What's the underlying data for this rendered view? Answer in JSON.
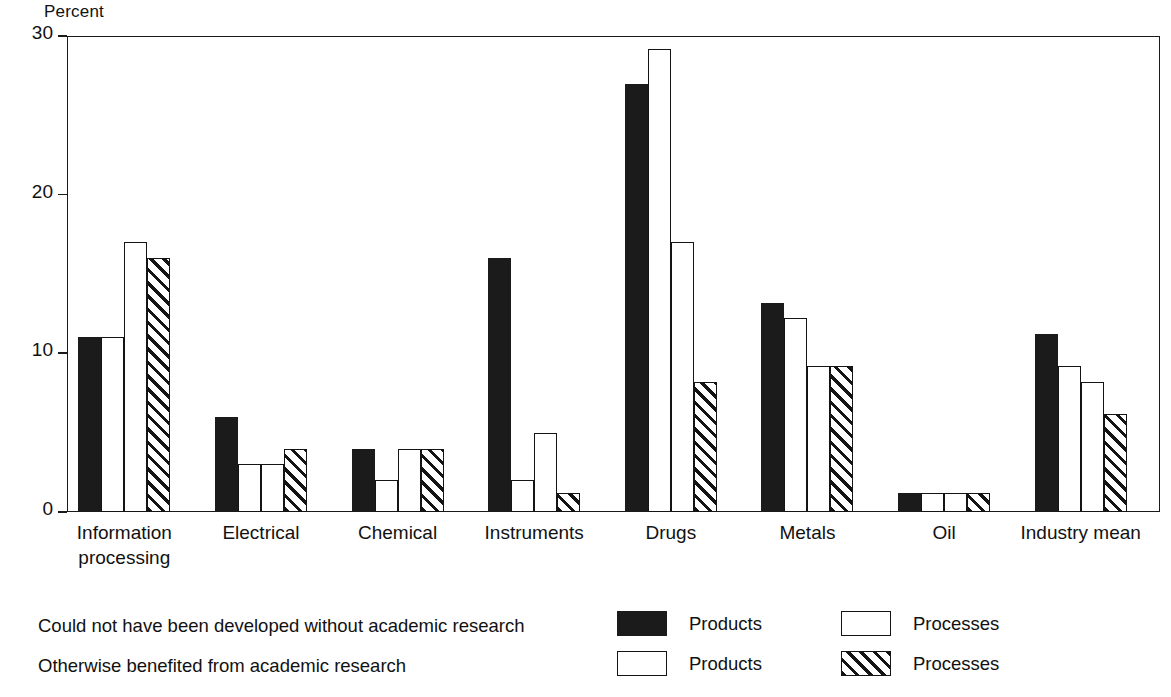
{
  "chart_data": {
    "type": "bar",
    "title": "",
    "subtitle": "",
    "xlabel": "",
    "ylabel": "Percent",
    "ylim": [
      0,
      30
    ],
    "yticks": [
      0,
      10,
      20,
      30
    ],
    "ytick_labels": [
      "0",
      "10",
      "20",
      "30"
    ],
    "grid": false,
    "legend_position": "below-plot",
    "categories": [
      "Information\nprocessing",
      "Electrical",
      "Chemical",
      "Instruments",
      "Drugs",
      "Metals",
      "Oil",
      "Industry mean"
    ],
    "series": [
      {
        "name": "Products",
        "group": "Could not have been developed without academic research",
        "fill": "solid",
        "values": [
          11.0,
          6.0,
          4.0,
          16.0,
          27.0,
          13.2,
          1.2,
          11.2
        ]
      },
      {
        "name": "Processes",
        "group": "Could not have been developed without academic research",
        "fill": "open",
        "values": [
          11.0,
          3.0,
          2.0,
          2.0,
          29.2,
          12.2,
          1.2,
          9.2
        ]
      },
      {
        "name": "Products",
        "group": "Otherwise benefited from academic research",
        "fill": "open",
        "values": [
          17.0,
          3.0,
          4.0,
          5.0,
          17.0,
          9.2,
          1.2,
          8.2
        ]
      },
      {
        "name": "Processes",
        "group": "Otherwise benefited from academic research",
        "fill": "hatch",
        "values": [
          16.0,
          4.0,
          4.0,
          1.2,
          8.2,
          9.2,
          1.2,
          6.2
        ]
      }
    ],
    "legend": {
      "descriptions": [
        "Could not have been developed without academic research",
        "Otherwise benefited from academic research"
      ],
      "keys": [
        {
          "fill": "solid",
          "label": "Products"
        },
        {
          "fill": "open",
          "label": "Processes"
        },
        {
          "fill": "open",
          "label": "Products"
        },
        {
          "fill": "hatch",
          "label": "Processes"
        }
      ]
    },
    "colors": {
      "solid": "#1b1b1b",
      "open": "#ffffff",
      "hatch_line": "#141414",
      "axis": "#1a1a1a",
      "background": "#ffffff"
    }
  }
}
